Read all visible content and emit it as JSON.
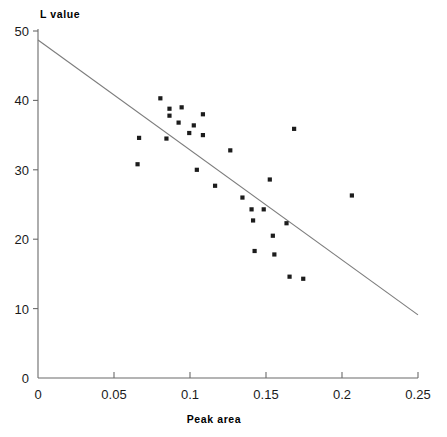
{
  "chart_data": {
    "type": "scatter",
    "title": "",
    "xlabel": "Peak area",
    "ylabel": "L value",
    "xlim": [
      0,
      0.25
    ],
    "ylim": [
      0,
      50
    ],
    "xticks": [
      0,
      0.05,
      0.1,
      0.15,
      0.2,
      0.25
    ],
    "xtick_labels": [
      "0",
      "0.05",
      "0.1",
      "0.15",
      "0.2",
      "0.25"
    ],
    "yticks": [
      0,
      10,
      20,
      30,
      40,
      50
    ],
    "ytick_labels": [
      "0",
      "10",
      "20",
      "30",
      "40",
      "50"
    ],
    "grid": false,
    "legend": null,
    "marker": "square",
    "marker_color": "#1c1c1c",
    "line_color": "#7c7c7c",
    "points": [
      {
        "x": 0.0665,
        "y": 34.6
      },
      {
        "x": 0.0655,
        "y": 30.8
      },
      {
        "x": 0.0805,
        "y": 40.3
      },
      {
        "x": 0.0865,
        "y": 38.8
      },
      {
        "x": 0.0865,
        "y": 37.8
      },
      {
        "x": 0.0845,
        "y": 34.5
      },
      {
        "x": 0.0925,
        "y": 36.8
      },
      {
        "x": 0.0945,
        "y": 39.0
      },
      {
        "x": 0.0995,
        "y": 35.3
      },
      {
        "x": 0.1025,
        "y": 36.4
      },
      {
        "x": 0.1045,
        "y": 30.0
      },
      {
        "x": 0.1085,
        "y": 38.0
      },
      {
        "x": 0.1085,
        "y": 35.0
      },
      {
        "x": 0.1165,
        "y": 27.7
      },
      {
        "x": 0.1265,
        "y": 32.8
      },
      {
        "x": 0.1345,
        "y": 26.0
      },
      {
        "x": 0.1405,
        "y": 24.3
      },
      {
        "x": 0.1415,
        "y": 22.7
      },
      {
        "x": 0.1425,
        "y": 18.3
      },
      {
        "x": 0.1485,
        "y": 24.3
      },
      {
        "x": 0.1525,
        "y": 28.6
      },
      {
        "x": 0.1545,
        "y": 20.5
      },
      {
        "x": 0.1555,
        "y": 17.8
      },
      {
        "x": 0.1635,
        "y": 22.3
      },
      {
        "x": 0.1655,
        "y": 14.6
      },
      {
        "x": 0.1685,
        "y": 35.9
      },
      {
        "x": 0.1745,
        "y": 14.3
      },
      {
        "x": 0.2065,
        "y": 26.3
      }
    ],
    "fit_line": {
      "x0": 0.0,
      "y0": 48.7,
      "x1": 0.25,
      "y1": 9.1
    }
  }
}
